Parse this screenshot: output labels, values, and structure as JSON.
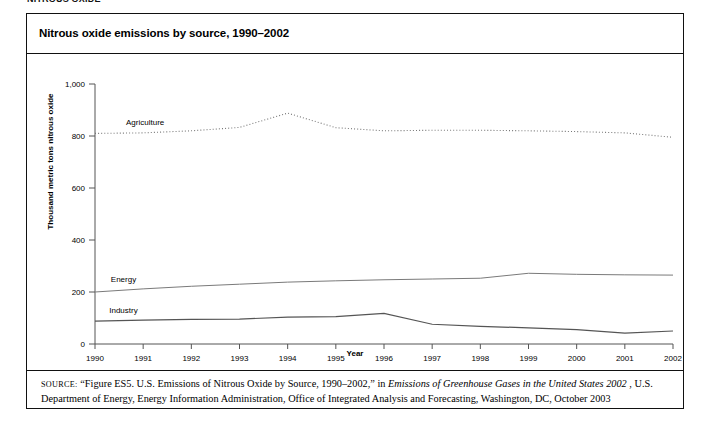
{
  "running_head": "NITROUS OXIDE",
  "figure": {
    "title": "Nitrous oxide emissions by source, 1990–2002",
    "source_prefix": "SOURCE:",
    "source_part1": "“Figure ES5. U.S. Emissions of Nitrous Oxide by Source, 1990–2002,” in ",
    "source_italic": "Emissions of Greenhouse Gases in the United States 2002",
    "source_part2": ", U.S. Department of Energy, Energy Information Administration, Office of Integrated Analysis and Forecasting, Washington, DC, October 2003"
  },
  "colors": {
    "frame": "#111111",
    "axis": "#555555",
    "agriculture": "#777777",
    "energy": "#7a7a7a",
    "industry": "#555555",
    "text": "#000000"
  },
  "chart_data": {
    "type": "line",
    "title": "Nitrous oxide emissions by source, 1990–2002",
    "xlabel": "Year",
    "ylabel": "Thousand metric tons nitrous oxide",
    "grid": false,
    "legend_position": "inline-labels",
    "x": [
      1990,
      1991,
      1992,
      1993,
      1994,
      1995,
      1996,
      1997,
      1998,
      1999,
      2000,
      2001,
      2002
    ],
    "xlim": [
      1990,
      2002
    ],
    "ylim": [
      0,
      1000
    ],
    "yticks": [
      0,
      200,
      400,
      600,
      800,
      1000
    ],
    "ytick_labels": [
      "0",
      "200",
      "400",
      "600",
      "800",
      "1,000"
    ],
    "xtick_labels": [
      "1990",
      "1991",
      "1992",
      "1993",
      "1994",
      "1995",
      "1996",
      "1997",
      "1998",
      "1999",
      "2000",
      "2001",
      "2002"
    ],
    "series": [
      {
        "name": "Agriculture",
        "style": "dotted",
        "values": [
          810,
          812,
          820,
          833,
          888,
          832,
          820,
          822,
          822,
          820,
          817,
          812,
          795
        ]
      },
      {
        "name": "Energy",
        "style": "solid",
        "values": [
          200,
          212,
          222,
          230,
          238,
          243,
          247,
          250,
          253,
          272,
          268,
          266,
          265
        ]
      },
      {
        "name": "Industry",
        "style": "solid",
        "values": [
          88,
          92,
          95,
          96,
          103,
          105,
          118,
          76,
          68,
          62,
          55,
          42,
          50
        ]
      }
    ]
  }
}
